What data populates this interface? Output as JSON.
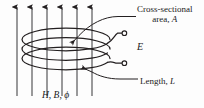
{
  "figure": {
    "name": "inductor-coil-in-magnetic-field-diagram",
    "ink_color": "#231f20",
    "background_color": "#fdfdfd",
    "width": 204,
    "height": 108
  },
  "labels": {
    "cross_section": {
      "line1": "Cross-sectional",
      "line2_prefix": "area, ",
      "line2_symbol": "A"
    },
    "emf": {
      "symbol": "E"
    },
    "length": {
      "prefix": "Length, ",
      "symbol": "L"
    },
    "field": {
      "text": "H, B, ϕ"
    }
  },
  "icons": {
    "field_arrow": "up-arrow-icon",
    "coil": "helical-coil-icon",
    "terminal_top": "terminal-circle-icon",
    "terminal_bottom": "terminal-circle-icon",
    "leader_cross_section": "leader-arrow-icon",
    "leader_length": "leader-arrow-icon"
  },
  "geometry": {
    "field_arrow_x_positions": [
      17,
      32,
      47,
      62,
      77,
      92
    ],
    "field_arrow_top_y": 5,
    "field_arrow_bottom_y": 96,
    "coil_center_x": 66,
    "coil_center_y": 51,
    "coil_rx": 44,
    "coil_ry": 12,
    "coil_turns": 3,
    "terminal_top": {
      "x": 125,
      "y": 33
    },
    "terminal_bottom": {
      "x": 125,
      "y": 63
    }
  }
}
